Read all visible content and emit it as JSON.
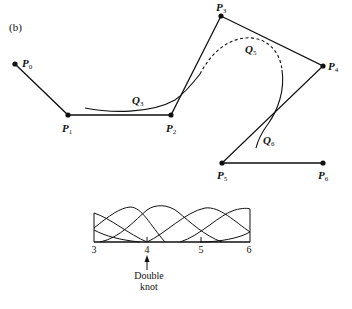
{
  "panel_label": "(b)",
  "control_points": [
    {
      "name": "P",
      "sub": "0",
      "x": 15,
      "y": 64
    },
    {
      "name": "P",
      "sub": "1",
      "x": 68,
      "y": 115
    },
    {
      "name": "P",
      "sub": "2",
      "x": 171,
      "y": 115
    },
    {
      "name": "P",
      "sub": "3",
      "x": 221,
      "y": 16
    },
    {
      "name": "P",
      "sub": "4",
      "x": 323,
      "y": 66
    },
    {
      "name": "P",
      "sub": "5",
      "x": 222,
      "y": 163
    },
    {
      "name": "P",
      "sub": "6",
      "x": 323,
      "y": 163
    }
  ],
  "segments": [
    {
      "name": "Q",
      "sub": "3",
      "style": "solid"
    },
    {
      "name": "Q",
      "sub": "5",
      "style": "dashed"
    },
    {
      "name": "Q",
      "sub": "6",
      "style": "solid"
    }
  ],
  "basis_plot": {
    "x_ticks": [
      "3",
      "4",
      "5",
      "6"
    ],
    "annotation": {
      "line1": "Double",
      "line2": "knot"
    }
  }
}
